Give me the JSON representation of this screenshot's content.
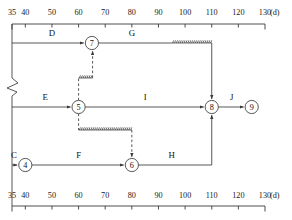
{
  "diagram": {
    "kind": "time-scaled-network-diagram",
    "unit_label": "(d)",
    "axis": {
      "min": 35,
      "max": 130,
      "ticks": [
        35,
        40,
        50,
        60,
        70,
        80,
        90,
        100,
        110,
        120,
        130
      ],
      "tick_labels": [
        "35",
        "40",
        "50",
        "60",
        "70",
        "80",
        "90",
        "100",
        "110",
        "120",
        "130"
      ],
      "top_axis_present": true,
      "bottom_axis_present": true
    },
    "nodes": [
      {
        "id": "4",
        "label": "4",
        "day": 40,
        "row": "bottom"
      },
      {
        "id": "5",
        "label": "5",
        "day": 60,
        "row": "middle"
      },
      {
        "id": "6",
        "label": "6",
        "day": 80,
        "row": "bottom"
      },
      {
        "id": "7",
        "label": "7",
        "day": 65,
        "row": "top"
      },
      {
        "id": "8",
        "label": "8",
        "day": 110,
        "row": "middle"
      },
      {
        "id": "9",
        "label": "9",
        "day": 125,
        "row": "middle"
      }
    ],
    "activities": [
      {
        "label": "D",
        "from_day": 35,
        "to_day": 65,
        "row": "top",
        "style": "solid",
        "to_node": "7"
      },
      {
        "label": "G",
        "from_day": 65,
        "to_day": 95,
        "row": "top",
        "style": "solid",
        "float_from_day": 95,
        "float_to_day": 110,
        "to_node": "8"
      },
      {
        "label": "E",
        "from_day": 35,
        "to_day": 60,
        "row": "middle",
        "style": "solid",
        "to_node": "5"
      },
      {
        "label": "I",
        "from_day": 60,
        "to_day": 110,
        "row": "middle",
        "style": "solid",
        "to_node": "8"
      },
      {
        "label": "J",
        "from_day": 110,
        "to_day": 125,
        "row": "middle",
        "style": "solid",
        "to_node": "9"
      },
      {
        "label": "C",
        "from_day": 35,
        "to_day": 40,
        "row": "bottom",
        "style": "solid",
        "to_node": "4"
      },
      {
        "label": "F",
        "from_day": 40,
        "to_day": 80,
        "row": "bottom",
        "style": "solid",
        "to_node": "6"
      },
      {
        "label": "H",
        "from_day": 80,
        "to_day": 110,
        "row": "bottom",
        "style": "solid",
        "to_node": "8"
      }
    ],
    "dummy_links": [
      {
        "from_node": "5",
        "to_node": "7",
        "style": "dashed",
        "has_float": true
      },
      {
        "from_node": "5",
        "to_node": "6",
        "style": "dashed",
        "has_float": true
      }
    ],
    "break_symbol_on_left_axis": true
  }
}
